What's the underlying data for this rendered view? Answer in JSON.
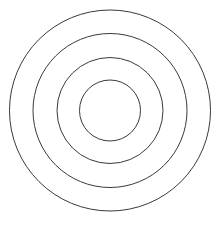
{
  "figure": {
    "canvas": {
      "width": 221,
      "height": 226,
      "background_color": "#ffffff"
    },
    "center": {
      "x": 110,
      "y": 110.5
    },
    "stroke": {
      "color": "#3a3a3a",
      "width": 1,
      "fill": "none"
    },
    "rings": [
      {
        "name": "outer-ring",
        "index": 1,
        "radius": 100.5,
        "diameter": 201,
        "left_edge_x": 9.5,
        "right_edge_x": 210.5,
        "top_edge_y": 10,
        "bottom_edge_y": 211,
        "stroke_color": "#3a3a3a",
        "stroke_width": 1,
        "fill": "none"
      },
      {
        "name": "second-ring",
        "index": 2,
        "radius": 77,
        "diameter": 154,
        "left_edge_x": 33,
        "right_edge_x": 187,
        "top_edge_y": 33.5,
        "bottom_edge_y": 187.5,
        "stroke_color": "#3a3a3a",
        "stroke_width": 1,
        "fill": "none"
      },
      {
        "name": "third-ring",
        "index": 3,
        "radius": 53,
        "diameter": 106,
        "left_edge_x": 57,
        "right_edge_x": 163,
        "top_edge_y": 57.5,
        "bottom_edge_y": 163.5,
        "stroke_color": "#3a3a3a",
        "stroke_width": 1,
        "fill": "none"
      },
      {
        "name": "inner-ring",
        "index": 4,
        "radius": 30.5,
        "diameter": 61,
        "left_edge_x": 79.5,
        "right_edge_x": 140.5,
        "top_edge_y": 80,
        "bottom_edge_y": 141,
        "stroke_color": "#3a3a3a",
        "stroke_width": 1,
        "fill": "none"
      }
    ]
  }
}
